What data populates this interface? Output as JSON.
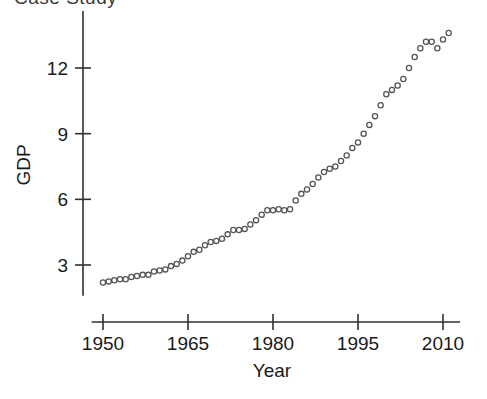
{
  "figure": {
    "width": 487,
    "height": 399,
    "background": "#ffffff",
    "clipped_header_text": "Case Study"
  },
  "chart_data": {
    "type": "scatter",
    "title": "",
    "xlabel": "Year",
    "ylabel": "GDP",
    "xlim": [
      1948,
      2013
    ],
    "ylim": [
      1.6,
      14.6
    ],
    "xticks": [
      1950,
      1965,
      1980,
      1995,
      2010
    ],
    "xticklabels": [
      "1950",
      "1965",
      "1980",
      "1995",
      "2010"
    ],
    "yticks": [
      3,
      6,
      9,
      12
    ],
    "yticklabels": [
      "3",
      "6",
      "9",
      "12"
    ],
    "grid": false,
    "legend": null,
    "marker": "open-circle",
    "marker_color": "#555555",
    "marker_size": 5.2,
    "x": [
      1950,
      1951,
      1952,
      1953,
      1954,
      1955,
      1956,
      1957,
      1958,
      1959,
      1960,
      1961,
      1962,
      1963,
      1964,
      1965,
      1966,
      1967,
      1968,
      1969,
      1970,
      1971,
      1972,
      1973,
      1974,
      1975,
      1976,
      1977,
      1978,
      1979,
      1980,
      1981,
      1982,
      1983,
      1984,
      1985,
      1986,
      1987,
      1988,
      1989,
      1990,
      1991,
      1992,
      1993,
      1994,
      1995,
      1996,
      1997,
      1998,
      1999,
      2000,
      2001,
      2002,
      2003,
      2004,
      2005,
      2006,
      2007,
      2008,
      2009,
      2010,
      2011
    ],
    "y": [
      2.2,
      2.25,
      2.3,
      2.35,
      2.35,
      2.45,
      2.5,
      2.55,
      2.55,
      2.7,
      2.75,
      2.8,
      2.95,
      3.05,
      3.2,
      3.4,
      3.6,
      3.7,
      3.9,
      4.05,
      4.1,
      4.2,
      4.4,
      4.6,
      4.6,
      4.65,
      4.85,
      5.05,
      5.3,
      5.5,
      5.5,
      5.55,
      5.5,
      5.55,
      5.95,
      6.25,
      6.45,
      6.7,
      7.0,
      7.25,
      7.4,
      7.5,
      7.75,
      8.0,
      8.35,
      8.6,
      9.0,
      9.4,
      9.8,
      10.3,
      10.8,
      11.0,
      11.2,
      11.5,
      12.0,
      12.5,
      12.9,
      13.2,
      13.2,
      12.9,
      13.3,
      13.6
    ]
  },
  "axes": {
    "y_axis_name": "gdp-axis",
    "x_axis_name": "year-axis"
  }
}
